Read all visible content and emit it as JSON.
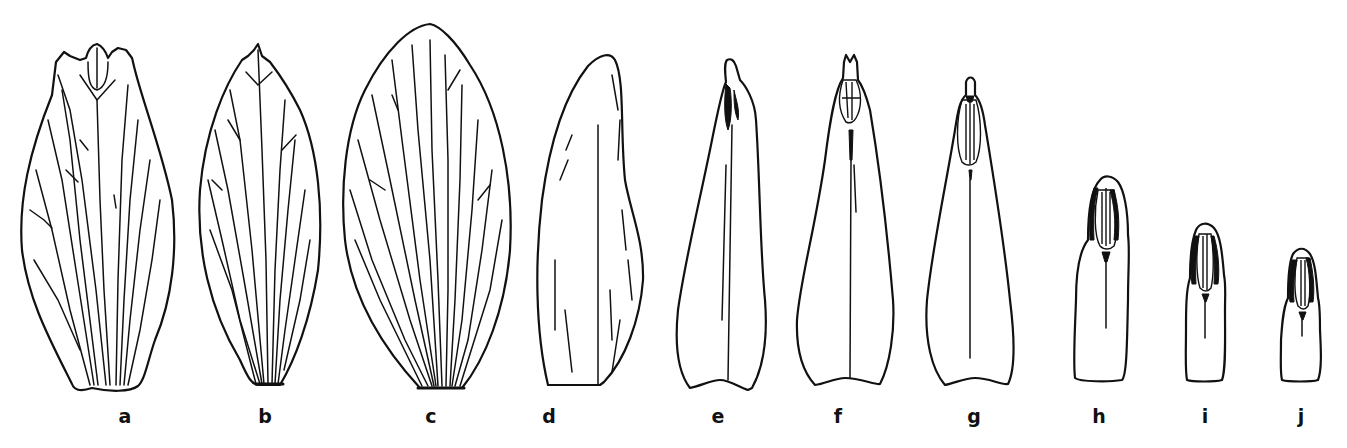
{
  "figure": {
    "panels": [
      {
        "id": "a",
        "label": "a"
      },
      {
        "id": "b",
        "label": "b"
      },
      {
        "id": "c",
        "label": "c"
      },
      {
        "id": "d",
        "label": "d"
      },
      {
        "id": "e",
        "label": "e"
      },
      {
        "id": "f",
        "label": "f"
      },
      {
        "id": "g",
        "label": "g"
      },
      {
        "id": "h",
        "label": "h"
      },
      {
        "id": "i",
        "label": "i"
      },
      {
        "id": "j",
        "label": "j"
      }
    ],
    "colors": {
      "ink": "#111111",
      "background": "#ffffff"
    }
  }
}
